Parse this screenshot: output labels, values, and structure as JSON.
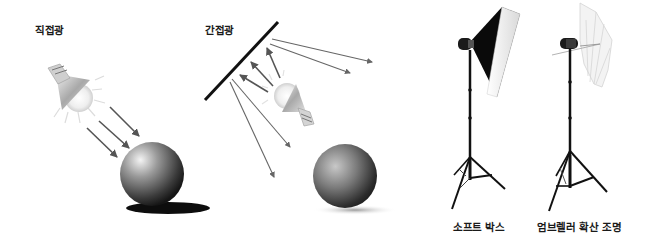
{
  "panels": {
    "direct_light": {
      "label": "직접광"
    },
    "indirect_light": {
      "label": "간접광"
    },
    "softbox": {
      "label": "소프트 박스"
    },
    "umbrella": {
      "label": "엄브렐러 확산 조명"
    }
  },
  "colors": {
    "arrow": "#555555",
    "line": "#111111",
    "sphere_dark": "#1e1e1e",
    "sphere_light": "#d8d8d8",
    "background": "#ffffff"
  }
}
